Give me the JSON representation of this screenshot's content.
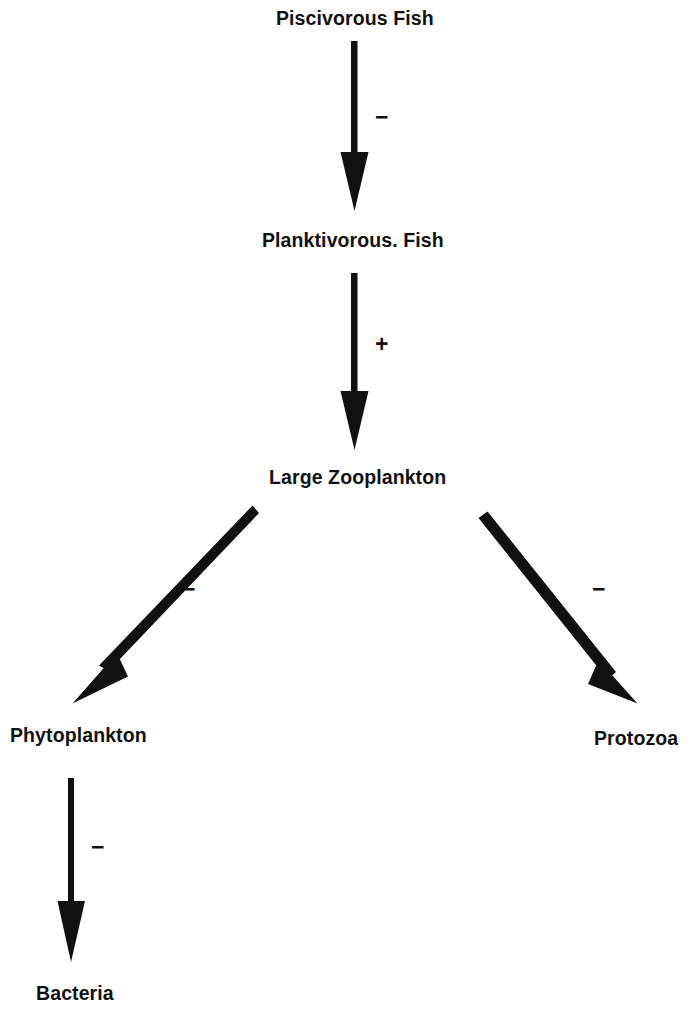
{
  "diagram": {
    "background_color": "#ffffff",
    "ink_color": "#111111",
    "nodes": [
      {
        "id": "piscivorous-fish",
        "label": "Piscivorous Fish"
      },
      {
        "id": "planktivorous-fish",
        "label": "Planktivorous. Fish"
      },
      {
        "id": "large-zooplankton",
        "label": "Large Zooplankton"
      },
      {
        "id": "phytoplankton",
        "label": "Phytoplankton"
      },
      {
        "id": "protozoa",
        "label": "Protozoa"
      },
      {
        "id": "bacteria",
        "label": "Bacteria"
      }
    ],
    "edges": [
      {
        "id": "pisc-plank",
        "from": "Piscivorous Fish",
        "to": "Planktivorous. Fish",
        "sign": "−",
        "direction": "down"
      },
      {
        "id": "plank-zoo",
        "from": "Planktivorous. Fish",
        "to": "Large Zooplankton",
        "sign": "+",
        "direction": "down"
      },
      {
        "id": "zoo-phyto",
        "from": "Large Zooplankton",
        "to": "Phytoplankton",
        "sign": "−",
        "direction": "down-left"
      },
      {
        "id": "zoo-proto",
        "from": "Large Zooplankton",
        "to": "Protozoa",
        "sign": "−",
        "direction": "down-right"
      },
      {
        "id": "phyto-bact",
        "from": "Phytoplankton",
        "to": "Bacteria",
        "sign": "−",
        "direction": "down"
      }
    ]
  }
}
